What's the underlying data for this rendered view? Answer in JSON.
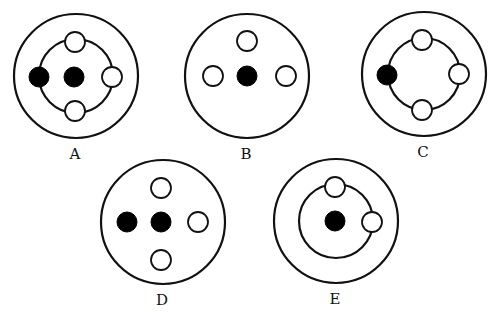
{
  "colors": {
    "line": "#111111",
    "filled": "#000000",
    "background": "#ffffff"
  },
  "diagrams": [
    {
      "label": "A",
      "center": [
        76,
        76
      ],
      "outer_radius": 62,
      "inner_ring_radius": 37,
      "filled": [
        [
          39,
          77
        ],
        [
          74,
          77
        ]
      ],
      "open": [
        [
          75,
          42
        ],
        [
          75,
          111
        ],
        [
          112,
          77
        ]
      ]
    },
    {
      "label": "B",
      "center": [
        247,
        76
      ],
      "outer_radius": 62,
      "inner_ring_radius": null,
      "filled": [
        [
          247,
          76
        ]
      ],
      "open": [
        [
          247,
          41
        ],
        [
          213,
          76
        ],
        [
          286,
          76
        ]
      ]
    },
    {
      "label": "C",
      "center": [
        424,
        74
      ],
      "outer_radius": 62,
      "inner_ring_radius": 36,
      "filled": [
        [
          387,
          75
        ]
      ],
      "open": [
        [
          422,
          40
        ],
        [
          422,
          110
        ],
        [
          459,
          74
        ]
      ]
    },
    {
      "label": "D",
      "center": [
        163,
        222
      ],
      "outer_radius": 62,
      "inner_ring_radius": null,
      "filled": [
        [
          127,
          222
        ],
        [
          161,
          222
        ]
      ],
      "open": [
        [
          161,
          188
        ],
        [
          161,
          260
        ],
        [
          198,
          222
        ]
      ]
    },
    {
      "label": "E",
      "center": [
        336,
        221
      ],
      "outer_radius": 62,
      "inner_ring_radius": 37,
      "filled": [
        [
          335,
          221
        ]
      ],
      "open": [
        [
          335,
          187
        ],
        [
          372,
          222
        ]
      ]
    }
  ],
  "small_circle_radius": 10,
  "label_offset_y": 78
}
